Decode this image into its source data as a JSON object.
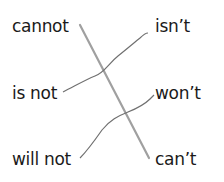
{
  "left_words": [
    {
      "label": "cannot"
    },
    {
      "label": "is not"
    },
    {
      "label": "will not"
    }
  ],
  "right_words": [
    {
      "label": "isn’t"
    },
    {
      "label": "won’t"
    },
    {
      "label": "can’t"
    }
  ],
  "matches": [
    {
      "from": "cannot",
      "to": "can’t",
      "style": "straight"
    },
    {
      "from": "is not",
      "to": "isn’t",
      "style": "wavy"
    },
    {
      "from": "will not",
      "to": "won’t",
      "style": "wavy"
    }
  ],
  "colors": {
    "text": "#1a1a1a",
    "line": "#9a9a9a",
    "wavy_line": "#6e6e6e"
  }
}
